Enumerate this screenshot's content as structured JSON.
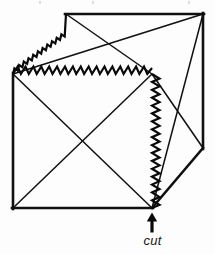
{
  "figure": {
    "background_color": "#fdfdfd",
    "line_color": "#101010"
  },
  "annotation": {
    "label": "cut",
    "arrow": "up-arrow",
    "arrow_direction": "up",
    "label_target_x": 152,
    "label_target_y": 208
  },
  "geometry": {
    "vertices": {
      "front_top_left": [
        13,
        74
      ],
      "front_top_right": [
        152,
        74
      ],
      "front_bottom_left": [
        13,
        208
      ],
      "front_bottom_right": [
        152,
        208
      ],
      "back_top_left": [
        66,
        14
      ],
      "back_top_right": [
        203,
        14
      ],
      "back_bottom_right": [
        203,
        148
      ]
    },
    "faces": [
      {
        "name": "front-face",
        "shape": "square",
        "points": "13,74 152,74 152,208 13,208",
        "diagonals": [
          {
            "name": "front-diagonal-a",
            "from": [
              13,
              74
            ],
            "to": [
              152,
              208
            ]
          },
          {
            "name": "front-diagonal-b",
            "from": [
              152,
              74
            ],
            "to": [
              13,
              208
            ]
          }
        ]
      },
      {
        "name": "top-face",
        "shape": "parallelogram",
        "points": "13,74 66,14 203,14 152,74",
        "diagonals": [
          {
            "name": "top-diagonal-a",
            "from": [
              13,
              74
            ],
            "to": [
              203,
              14
            ]
          },
          {
            "name": "top-diagonal-b",
            "from": [
              66,
              14
            ],
            "to": [
              152,
              74
            ]
          }
        ]
      },
      {
        "name": "right-face",
        "shape": "parallelogram",
        "points": "152,74 203,14 203,148 152,208",
        "diagonals": [
          {
            "name": "right-diagonal-a",
            "from": [
              152,
              74
            ],
            "to": [
              203,
              148
            ]
          },
          {
            "name": "right-diagonal-b",
            "from": [
              203,
              14
            ],
            "to": [
              152,
              208
            ]
          }
        ]
      }
    ],
    "solid_edges": [
      {
        "name": "edge-top-back",
        "from": [
          66,
          14
        ],
        "to": [
          203,
          14
        ]
      },
      {
        "name": "edge-right-back-vertical",
        "from": [
          203,
          14
        ],
        "to": [
          203,
          148
        ]
      },
      {
        "name": "edge-right-lower",
        "from": [
          203,
          148
        ],
        "to": [
          152,
          208
        ]
      },
      {
        "name": "edge-front-bottom",
        "from": [
          13,
          208
        ],
        "to": [
          152,
          208
        ]
      },
      {
        "name": "edge-front-left-vertical",
        "from": [
          13,
          74
        ],
        "to": [
          13,
          208
        ]
      }
    ],
    "cut_edges": [
      {
        "name": "cut-edge-top-left-diagonal",
        "from": [
          13,
          74
        ],
        "to": [
          66,
          14
        ],
        "style": "sawtooth"
      },
      {
        "name": "cut-edge-top-front-horizontal",
        "from": [
          13,
          74
        ],
        "to": [
          152,
          74
        ],
        "style": "sawtooth"
      },
      {
        "name": "cut-edge-front-right-vertical",
        "from": [
          152,
          74
        ],
        "to": [
          152,
          208
        ],
        "style": "sawtooth"
      }
    ]
  }
}
